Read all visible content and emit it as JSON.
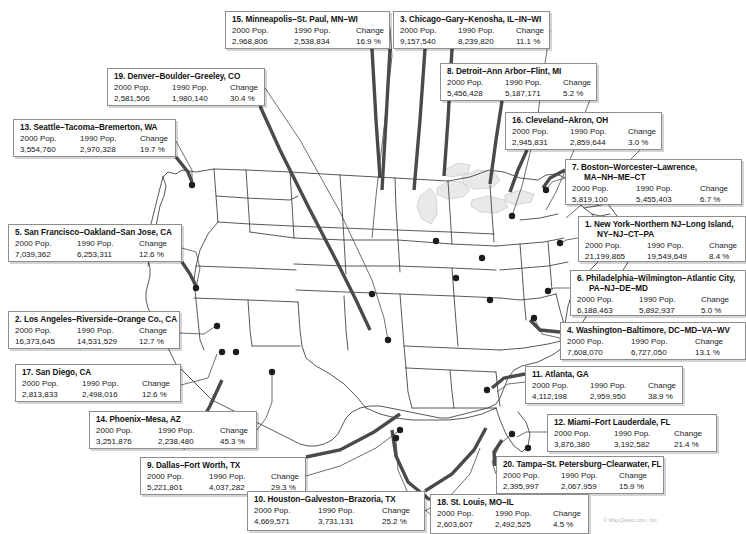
{
  "meta": {
    "columns": [
      "2000 Pop.",
      "1990 Pop.",
      "Change"
    ],
    "copyright": "© MapQuest.com, Inc."
  },
  "chart_data": {
    "type": "map",
    "title": "",
    "subtitle": "",
    "columns": [
      "2000 Pop.",
      "1990 Pop.",
      "Change"
    ],
    "regions": [
      {
        "rank": 1,
        "name": "1. New York–Northern NJ–Long Island,",
        "name2": "NY–NJ–CT–PA",
        "pop2000": "21,199,865",
        "pop1990": "19,549,649",
        "change": "8.4 %"
      },
      {
        "rank": 2,
        "name": "2. Los Angeles–Riverside–Orange Co., CA",
        "name2": "",
        "pop2000": "16,373,645",
        "pop1990": "14,531,529",
        "change": "12.7 %"
      },
      {
        "rank": 3,
        "name": "3. Chicago–Gary–Kenosha, IL–IN–WI",
        "name2": "",
        "pop2000": "9,157,540",
        "pop1990": "8,239,820",
        "change": "11.1 %"
      },
      {
        "rank": 4,
        "name": "4. Washington–Baltimore, DC–MD–VA–WV",
        "name2": "",
        "pop2000": "7,608,070",
        "pop1990": "6,727,050",
        "change": "13.1 %"
      },
      {
        "rank": 5,
        "name": "5. San Francisco–Oakland–San Jose, CA",
        "name2": "",
        "pop2000": "7,039,362",
        "pop1990": "6,253,311",
        "change": "12.6 %"
      },
      {
        "rank": 6,
        "name": "6. Philadelphia–Wilmington–Atlantic City,",
        "name2": "PA–NJ–DE–MD",
        "pop2000": "6,188,463",
        "pop1990": "5,892,937",
        "change": "5.0 %"
      },
      {
        "rank": 7,
        "name": "7. Boston–Worcester–Lawrence,",
        "name2": "MA–NH–ME–CT",
        "pop2000": "5,819,100",
        "pop1990": "5,455,403",
        "change": "6.7 %"
      },
      {
        "rank": 8,
        "name": "8. Detroit–Ann Arbor–Flint, MI",
        "name2": "",
        "pop2000": "5,456,428",
        "pop1990": "5,187,171",
        "change": "5.2 %"
      },
      {
        "rank": 9,
        "name": "9. Dallas–Fort Worth, TX",
        "name2": "",
        "pop2000": "5,221,801",
        "pop1990": "4,037,282",
        "change": "29.3 %"
      },
      {
        "rank": 10,
        "name": "10. Houston–Galveston–Brazoria, TX",
        "name2": "",
        "pop2000": "4,669,571",
        "pop1990": "3,731,131",
        "change": "25.2 %"
      },
      {
        "rank": 11,
        "name": "11. Atlanta, GA",
        "name2": "",
        "pop2000": "4,112,198",
        "pop1990": "2,959,950",
        "change": "38.9 %"
      },
      {
        "rank": 12,
        "name": "12. Miami–Fort Lauderdale, FL",
        "name2": "",
        "pop2000": "3,876,380",
        "pop1990": "3,192,582",
        "change": "21.4 %"
      },
      {
        "rank": 13,
        "name": "13. Seattle–Tacoma–Bremerton, WA",
        "name2": "",
        "pop2000": "3,554,760",
        "pop1990": "2,970,328",
        "change": "19.7 %"
      },
      {
        "rank": 14,
        "name": "14. Phoenix–Mesa, AZ",
        "name2": "",
        "pop2000": "3,251,876",
        "pop1990": "2,238,480",
        "change": "45.3 %"
      },
      {
        "rank": 15,
        "name": "15. Minneapolis–St. Paul, MN–WI",
        "name2": "",
        "pop2000": "2,968,806",
        "pop1990": "2,538,834",
        "change": "16.9 %"
      },
      {
        "rank": 16,
        "name": "16. Cleveland–Akron, OH",
        "name2": "",
        "pop2000": "2,945,831",
        "pop1990": "2,859,644",
        "change": "3.0 %"
      },
      {
        "rank": 17,
        "name": "17. San Diego, CA",
        "name2": "",
        "pop2000": "2,813,833",
        "pop1990": "2,498,016",
        "change": "12.6 %"
      },
      {
        "rank": 18,
        "name": "18. St. Louis, MO–IL",
        "name2": "",
        "pop2000": "2,603,607",
        "pop1990": "2,492,525",
        "change": "4.5 %"
      },
      {
        "rank": 19,
        "name": "19. Denver–Boulder–Greeley, CO",
        "name2": "",
        "pop2000": "2,581,506",
        "pop1990": "1,980,140",
        "change": "30.4 %"
      },
      {
        "rank": 20,
        "name": "20. Tampa–St. Petersburg–Clearwater, FL",
        "name2": "",
        "pop2000": "2,395,997",
        "pop1990": "2,067,959",
        "change": "15.9 %"
      }
    ]
  },
  "boxes": {
    "b15": {
      "x": 225,
      "y": 11,
      "w": 165,
      "h": 38,
      "cols": "62px 62px auto"
    },
    "b3": {
      "x": 393,
      "y": 11,
      "w": 157,
      "h": 38,
      "cols": "58px 58px auto"
    },
    "b19": {
      "x": 107,
      "y": 68,
      "w": 158,
      "h": 38,
      "cols": "58px 58px auto"
    },
    "b8": {
      "x": 440,
      "y": 63,
      "w": 157,
      "h": 38,
      "cols": "58px 58px auto"
    },
    "b13": {
      "x": 13,
      "y": 119,
      "w": 163,
      "h": 38,
      "cols": "60px 60px auto"
    },
    "b16": {
      "x": 505,
      "y": 112,
      "w": 157,
      "h": 38,
      "cols": "58px 58px auto"
    },
    "b7": {
      "x": 565,
      "y": 159,
      "w": 177,
      "h": 46,
      "cols": "64px 64px auto"
    },
    "b5": {
      "x": 8,
      "y": 224,
      "w": 174,
      "h": 38,
      "cols": "62px 62px auto"
    },
    "b1": {
      "x": 578,
      "y": 216,
      "w": 168,
      "h": 46,
      "cols": "62px 62px auto"
    },
    "b6": {
      "x": 570,
      "y": 270,
      "w": 176,
      "h": 46,
      "cols": "62px 62px auto"
    },
    "b2": {
      "x": 8,
      "y": 311,
      "w": 172,
      "h": 38,
      "cols": "62px 62px auto"
    },
    "b4": {
      "x": 560,
      "y": 322,
      "w": 186,
      "h": 38,
      "cols": "64px 64px auto"
    },
    "b17": {
      "x": 15,
      "y": 364,
      "w": 166,
      "h": 38,
      "cols": "60px 60px auto"
    },
    "b11": {
      "x": 525,
      "y": 366,
      "w": 158,
      "h": 38,
      "cols": "58px 58px auto"
    },
    "b14": {
      "x": 89,
      "y": 411,
      "w": 168,
      "h": 38,
      "cols": "62px 62px auto"
    },
    "b12": {
      "x": 547,
      "y": 414,
      "w": 170,
      "h": 38,
      "cols": "60px 60px auto"
    },
    "b9": {
      "x": 140,
      "y": 457,
      "w": 166,
      "h": 38,
      "cols": "62px 62px auto"
    },
    "b20": {
      "x": 496,
      "y": 456,
      "w": 168,
      "h": 38,
      "cols": "58px 58px auto"
    },
    "b10": {
      "x": 247,
      "y": 491,
      "w": 178,
      "h": 40,
      "cols": "64px 64px auto"
    },
    "b18": {
      "x": 430,
      "y": 494,
      "w": 159,
      "h": 40,
      "cols": "58px 58px auto"
    }
  }
}
